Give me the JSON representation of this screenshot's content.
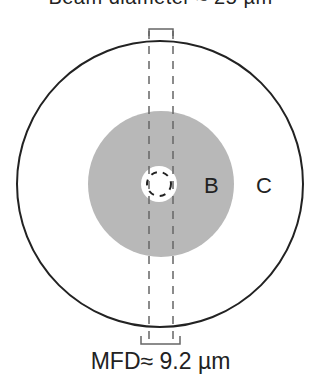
{
  "diagram": {
    "top_text_clipped": "Beam diameter ≈ 25 µm",
    "regions": [
      {
        "id": "A",
        "label": "",
        "description": "core (white, dashed mode boundary)"
      },
      {
        "id": "B",
        "label": "B",
        "description": "inner cladding (gray)"
      },
      {
        "id": "C",
        "label": "C",
        "description": "outer cladding (white)"
      }
    ],
    "mfd_label": "MFD≈ 9.2 µm",
    "colors": {
      "outline": "#222222",
      "gray_region": "#b8b8b8",
      "dashes": "#666666",
      "background": "#ffffff"
    }
  }
}
